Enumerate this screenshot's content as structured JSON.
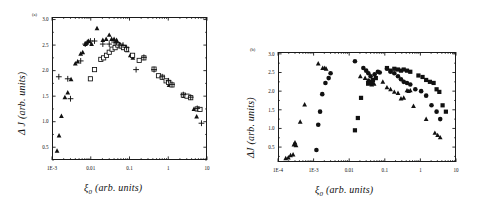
{
  "figure": {
    "panels": [
      {
        "tag": "(a)",
        "xlabel_symbol": "ξ",
        "xlabel_sub": "0",
        "xlabel_rest": "(arb. units)",
        "ylabel": "Δ J  (arb. units)",
        "xticklabels": [
          "1E-3",
          "0.01",
          "0.1",
          "1",
          "10"
        ],
        "yticklabels": [
          "0.5",
          "1.0",
          "1.5",
          "2.0",
          "2.5",
          "3.0"
        ]
      },
      {
        "tag": "(b)",
        "xlabel_symbol": "ξ",
        "xlabel_sub": "0",
        "xlabel_rest": "(arb. units)",
        "ylabel": "ΔJ (arb. units)",
        "xticklabels": [
          "1E-4",
          "1E-3",
          "0.01",
          "0.1",
          "1",
          "10"
        ],
        "yticklabels": [
          "0.5",
          "1.0",
          "1.5",
          "2.0",
          "2.5",
          "3.0"
        ]
      }
    ]
  },
  "chart_data": [
    {
      "type": "scatter",
      "panel": "(a)",
      "title": "",
      "xlabel": "ξ0 (arb. units)",
      "ylabel": "ΔJ (arb. units)",
      "xscale": "log",
      "xlim": [
        0.001,
        10
      ],
      "ylim": [
        0.25,
        3.05
      ],
      "xticks": [
        0.001,
        0.01,
        0.1,
        1,
        10
      ],
      "yticks": [
        0.5,
        1.0,
        1.5,
        2.0,
        2.5,
        3.0
      ],
      "grid": false,
      "legend": "none",
      "series": [
        {
          "name": "filled-triangle",
          "marker": "triangle",
          "fill": "#111111",
          "points": [
            [
              0.00135,
              0.43
            ],
            [
              0.00152,
              0.73
            ],
            [
              0.00175,
              1.11
            ],
            [
              0.00215,
              1.48
            ],
            [
              0.00255,
              1.57
            ],
            [
              0.0031,
              1.83
            ],
            [
              0.004,
              2.14
            ],
            [
              0.0046,
              2.18
            ],
            [
              0.0055,
              2.33
            ],
            [
              0.0062,
              2.36
            ],
            [
              0.0072,
              2.52
            ],
            [
              0.008,
              2.55
            ],
            [
              0.0088,
              2.58
            ],
            [
              0.0105,
              2.52
            ],
            [
              0.0145,
              2.83
            ],
            [
              0.0205,
              2.6
            ],
            [
              0.025,
              2.62
            ],
            [
              0.03,
              2.7
            ],
            [
              0.0345,
              2.62
            ],
            [
              0.04,
              2.62
            ],
            [
              0.0465,
              2.6
            ],
            [
              0.056,
              2.52
            ],
            [
              0.072,
              2.44
            ],
            [
              0.088,
              2.4
            ],
            [
              0.105,
              2.3
            ],
            [
              0.122,
              2.25
            ],
            [
              1.05,
              1.72
            ],
            [
              2.55,
              1.5
            ],
            [
              4.6,
              1.25
            ],
            [
              5.4,
              1.1
            ]
          ]
        },
        {
          "name": "open-square",
          "marker": "square-open",
          "fill": "#ffffff",
          "points": [
            [
              0.0098,
              1.84
            ],
            [
              0.0125,
              2.02
            ],
            [
              0.0182,
              2.22
            ],
            [
              0.0215,
              2.25
            ],
            [
              0.0255,
              2.3
            ],
            [
              0.03,
              2.36
            ],
            [
              0.0355,
              2.42
            ],
            [
              0.0425,
              2.45
            ],
            [
              0.05,
              2.5
            ],
            [
              0.06,
              2.48
            ],
            [
              0.07,
              2.45
            ],
            [
              0.084,
              2.42
            ],
            [
              0.12,
              2.3
            ],
            [
              0.178,
              2.2
            ],
            [
              0.235,
              2.25
            ],
            [
              0.43,
              2.03
            ],
            [
              0.56,
              1.9
            ],
            [
              0.7,
              1.87
            ],
            [
              0.88,
              1.8
            ],
            [
              1.02,
              1.77
            ],
            [
              1.25,
              1.72
            ],
            [
              2.45,
              1.52
            ],
            [
              3.05,
              1.5
            ],
            [
              3.8,
              1.47
            ],
            [
              5.6,
              1.25
            ],
            [
              6.6,
              1.24
            ]
          ]
        },
        {
          "name": "plus",
          "marker": "plus",
          "fill": "#111111",
          "points": [
            [
              0.0015,
              1.88
            ],
            [
              0.00255,
              1.84
            ],
            [
              0.003,
              1.45
            ],
            [
              0.0055,
              2.19
            ],
            [
              0.0072,
              2.52
            ],
            [
              0.0082,
              2.55
            ],
            [
              0.0098,
              2.58
            ],
            [
              0.0125,
              2.58
            ],
            [
              0.0205,
              2.52
            ],
            [
              0.03,
              2.52
            ],
            [
              0.04,
              2.56
            ],
            [
              0.0465,
              2.55
            ],
            [
              0.056,
              2.5
            ],
            [
              0.068,
              2.5
            ],
            [
              0.084,
              2.45
            ],
            [
              0.148,
              2.02
            ],
            [
              0.235,
              2.26
            ],
            [
              0.43,
              2.02
            ],
            [
              0.7,
              1.88
            ],
            [
              1.02,
              1.8
            ],
            [
              1.25,
              1.73
            ],
            [
              2.45,
              1.53
            ],
            [
              3.8,
              1.48
            ],
            [
              5.6,
              1.26
            ],
            [
              7.2,
              0.97
            ]
          ]
        }
      ]
    },
    {
      "type": "scatter",
      "panel": "(b)",
      "title": "",
      "xlabel": "ξ0 (arb. units)",
      "ylabel": "ΔJ (arb. units)",
      "xscale": "log",
      "xlim": [
        0.0001,
        10
      ],
      "ylim": [
        0.1,
        3.05
      ],
      "xticks": [
        0.0001,
        0.001,
        0.01,
        0.1,
        1,
        10
      ],
      "yticks": [
        0.5,
        1.0,
        1.5,
        2.0,
        2.5,
        3.0
      ],
      "grid": false,
      "legend": "none",
      "series": [
        {
          "name": "filled-triangle",
          "marker": "triangle",
          "fill": "#111111",
          "points": [
            [
              0.000165,
              0.2
            ],
            [
              0.000195,
              0.22
            ],
            [
              0.000225,
              0.28
            ],
            [
              0.000265,
              0.3
            ],
            [
              0.00028,
              0.57
            ],
            [
              0.0003,
              0.62
            ],
            [
              0.00032,
              0.55
            ],
            [
              0.00042,
              1.18
            ],
            [
              0.00056,
              1.64
            ],
            [
              0.00135,
              2.74
            ],
            [
              0.0018,
              2.62
            ],
            [
              0.00205,
              2.62
            ],
            [
              0.00225,
              2.6
            ],
            [
              0.0205,
              2.4
            ],
            [
              0.028,
              2.35
            ],
            [
              0.034,
              2.3
            ],
            [
              0.0375,
              2.28
            ],
            [
              0.04,
              2.22
            ],
            [
              0.043,
              2.18
            ],
            [
              0.0465,
              2.22
            ],
            [
              0.05,
              2.2
            ],
            [
              0.088,
              2.25
            ],
            [
              0.115,
              2.1
            ],
            [
              0.145,
              2.05
            ],
            [
              0.185,
              1.98
            ],
            [
              0.235,
              1.95
            ],
            [
              0.285,
              1.8
            ],
            [
              0.34,
              1.82
            ],
            [
              0.42,
              2.02
            ],
            [
              0.465,
              2.0
            ],
            [
              0.52,
              2.02
            ],
            [
              0.64,
              1.6
            ],
            [
              1.45,
              1.25
            ],
            [
              2.55,
              0.88
            ],
            [
              3.05,
              0.82
            ],
            [
              3.6,
              0.76
            ]
          ]
        },
        {
          "name": "filled-circle",
          "marker": "circle",
          "fill": "#111111",
          "points": [
            [
              0.0012,
              0.42
            ],
            [
              0.00135,
              1.1
            ],
            [
              0.00152,
              1.45
            ],
            [
              0.00175,
              1.92
            ],
            [
              0.00215,
              2.22
            ],
            [
              0.00265,
              2.35
            ],
            [
              0.003,
              2.48
            ],
            [
              0.0145,
              2.8
            ],
            [
              0.025,
              2.62
            ],
            [
              0.03,
              2.55
            ],
            [
              0.0345,
              2.48
            ],
            [
              0.04,
              2.4
            ],
            [
              0.052,
              2.45
            ],
            [
              0.064,
              2.52
            ],
            [
              0.072,
              2.5
            ],
            [
              0.115,
              2.6
            ],
            [
              0.145,
              2.52
            ],
            [
              0.185,
              2.48
            ],
            [
              0.235,
              2.4
            ],
            [
              0.285,
              2.32
            ],
            [
              0.34,
              2.25
            ],
            [
              0.42,
              2.22
            ],
            [
              0.52,
              2.18
            ],
            [
              0.72,
              2.05
            ],
            [
              1.05,
              2.0
            ],
            [
              1.45,
              1.88
            ],
            [
              2.05,
              1.62
            ],
            [
              2.85,
              1.45
            ],
            [
              3.6,
              1.25
            ]
          ]
        },
        {
          "name": "filled-square",
          "marker": "square",
          "fill": "#111111",
          "points": [
            [
              0.0145,
              0.95
            ],
            [
              0.0175,
              1.28
            ],
            [
              0.0215,
              1.82
            ],
            [
              0.034,
              2.2
            ],
            [
              0.04,
              2.25
            ],
            [
              0.0465,
              2.3
            ],
            [
              0.056,
              2.35
            ],
            [
              0.115,
              2.62
            ],
            [
              0.145,
              2.55
            ],
            [
              0.185,
              2.6
            ],
            [
              0.235,
              2.58
            ],
            [
              0.285,
              2.55
            ],
            [
              0.34,
              2.58
            ],
            [
              0.42,
              2.55
            ],
            [
              0.52,
              2.52
            ],
            [
              0.88,
              2.42
            ],
            [
              1.15,
              2.38
            ],
            [
              1.45,
              2.3
            ],
            [
              1.85,
              2.25
            ],
            [
              2.35,
              2.22
            ],
            [
              2.85,
              2.05
            ],
            [
              3.4,
              1.98
            ],
            [
              4.2,
              1.62
            ],
            [
              5.2,
              1.45
            ]
          ]
        }
      ]
    }
  ]
}
